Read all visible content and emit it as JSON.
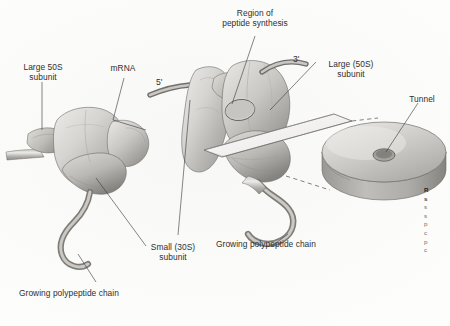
{
  "figure": {
    "background_color": "#fbfbfa",
    "line_color": "#3a3a3a",
    "label_color": "#2f2f2f",
    "structure_fill_light": "#e2e0de",
    "structure_fill_mid": "#b9b7b4",
    "structure_fill_dark": "#8e8c89",
    "plane_fill": "#f2f1ef"
  },
  "labels": {
    "large_50s_subunit_left": "Large 50S\nsubunit",
    "large_50s_subunit_left_line1": "Large 50S",
    "large_50s_subunit_left_line2": "subunit",
    "mrna": "mRNA",
    "region_of_peptide_synthesis_line1": "Region of",
    "region_of_peptide_synthesis_line2": "peptide synthesis",
    "large_50s_subunit_right_line1": "Large (50S)",
    "large_50s_subunit_right_line2": "subunit",
    "tunnel": "Tunnel",
    "small_30s_subunit_line1": "Small (30S)",
    "small_30s_subunit_line2": "subunit",
    "growing_polypeptide_chain_left": "Growing polypeptide chain",
    "growing_polypeptide_chain_right": "Growing polypeptide chain",
    "five_prime": "5'",
    "three_prime": "3'"
  },
  "caption": {
    "line1": "R",
    "line2": "s",
    "line3": "s",
    "line4": "s",
    "line5": "p",
    "line6": "c",
    "line7": "p",
    "line8": "c"
  }
}
